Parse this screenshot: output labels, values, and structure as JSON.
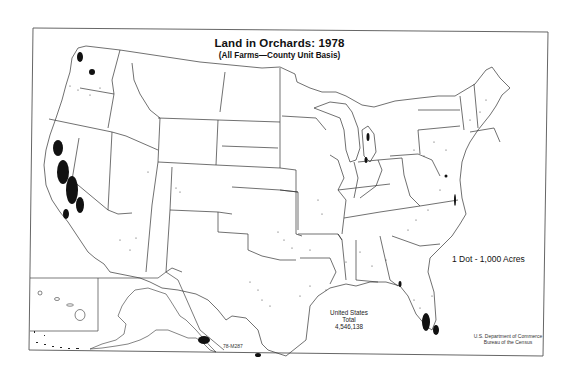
{
  "map": {
    "title": "Land in Orchards:  1978",
    "subtitle": "(All Farms—County Unit Basis)",
    "legend": "1 Dot - 1,000 Acres",
    "total": {
      "line1": "United States",
      "line2": "Total",
      "value": "4,546,138"
    },
    "figure_code": "78-M287",
    "credit": {
      "line1": "U.S. Department of Commerce",
      "line2": "Bureau of the Census"
    },
    "insets": [
      "Hawaii",
      "Alaska"
    ],
    "colors": {
      "background": "#ffffff",
      "lines": "#333333",
      "dots": "#111111"
    }
  }
}
